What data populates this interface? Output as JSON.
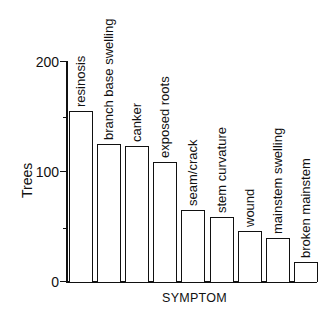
{
  "chart_data": {
    "type": "bar",
    "title": "",
    "xlabel": "SYMPTOM",
    "ylabel": "Trees",
    "ylim": [
      0,
      200
    ],
    "yticks": [
      0,
      100,
      200
    ],
    "yminor_ticks": [
      50,
      150
    ],
    "grid": false,
    "legend": null,
    "bar_labels_position": "rotated vertical above each bar",
    "categories": [
      "resinosis",
      "branch base swelling",
      "canker",
      "exposed roots",
      "seam/crack",
      "stem curvature",
      "wound",
      "mainstem swelling",
      "broken mainstem"
    ],
    "values": [
      155,
      125,
      123,
      109,
      65,
      59,
      46,
      40,
      18
    ]
  },
  "axis": {
    "ytick_labels": [
      "0",
      "100",
      "200"
    ],
    "ylabel": "Trees",
    "xlabel": "SYMPTOM"
  },
  "bars": [
    {
      "label": "resinosis",
      "value": 155
    },
    {
      "label": "branch base swelling",
      "value": 125
    },
    {
      "label": "canker",
      "value": 123
    },
    {
      "label": "exposed roots",
      "value": 109
    },
    {
      "label": "seam/crack",
      "value": 65
    },
    {
      "label": "stem curvature",
      "value": 59
    },
    {
      "label": "wound",
      "value": 46
    },
    {
      "label": "mainstem swelling",
      "value": 40
    },
    {
      "label": "broken mainstem",
      "value": 18
    }
  ]
}
